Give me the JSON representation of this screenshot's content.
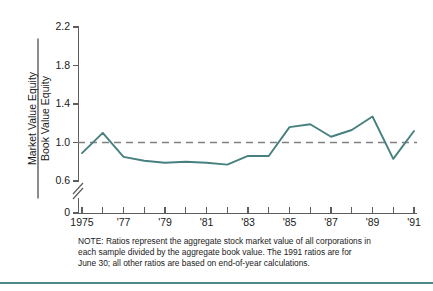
{
  "figure": {
    "ylabel_numerator": "Market Value Equity",
    "ylabel_denominator": "Book Value Equity",
    "note_line1": "NOTE: Ratios represent the aggregate stock market value of all corporations in",
    "note_line2": "each sample divided by the aggregate book value. The 1991 ratios are for",
    "note_line3": "June 30; all other ratios are based on end-of-year calculations.",
    "line_color": "#47807f",
    "reference_line_color": "#808080",
    "axis_color": "#5d5d5d",
    "rule_color": "#4e8a88"
  },
  "chart_data": {
    "type": "line",
    "title": "",
    "xlabel": "",
    "ylabel": "Market Value Equity / Book Value Equity",
    "ylim": [
      0.0,
      2.2
    ],
    "y_break": true,
    "y_break_between": [
      0.0,
      0.52
    ],
    "yticks": [
      0,
      0.6,
      1.0,
      1.4,
      1.8,
      2.2
    ],
    "ytick_labels": [
      "0",
      "0.6",
      "1.0",
      "1.4",
      "1.8",
      "2.2"
    ],
    "xlim": [
      1975,
      1991
    ],
    "xticks": [
      1975,
      1976,
      1977,
      1978,
      1979,
      1980,
      1981,
      1982,
      1983,
      1984,
      1985,
      1986,
      1987,
      1988,
      1989,
      1990,
      1991
    ],
    "xtick_labels": [
      "1975",
      "",
      "'77",
      "",
      "'79",
      "",
      "'81",
      "",
      "'83",
      "",
      "'85",
      "",
      "'87",
      "",
      "'89",
      "",
      "'91"
    ],
    "grid": false,
    "legend": "none",
    "annotations": [
      {
        "type": "hline",
        "y": 1.0,
        "style": "dashed",
        "label": "ratio = 1.0"
      }
    ],
    "series": [
      {
        "name": "Market Value Equity / Book Value Equity",
        "x": [
          1975,
          1976,
          1977,
          1978,
          1979,
          1980,
          1981,
          1982,
          1983,
          1984,
          1985,
          1986,
          1987,
          1988,
          1989,
          1990,
          1991
        ],
        "values": [
          0.89,
          1.1,
          0.85,
          0.81,
          0.79,
          0.8,
          0.79,
          0.77,
          0.86,
          0.86,
          1.16,
          1.19,
          1.06,
          1.13,
          1.27,
          0.83,
          1.12
        ]
      }
    ]
  }
}
